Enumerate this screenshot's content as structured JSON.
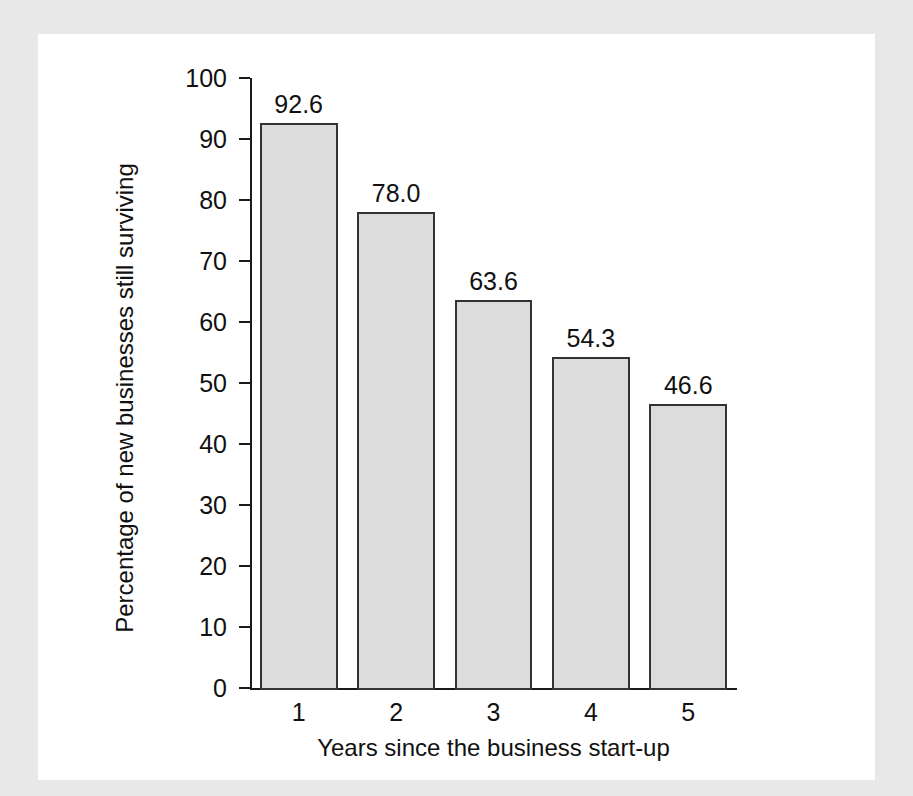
{
  "figure": {
    "background_color": "#e8e8e8",
    "card_color": "#ffffff"
  },
  "chart_data": {
    "type": "bar",
    "title": "",
    "xlabel": "Years since the business start-up",
    "ylabel": "Percentage of new businesses still surviving",
    "categories": [
      "1",
      "2",
      "3",
      "4",
      "5"
    ],
    "values": [
      92.6,
      78.0,
      63.6,
      54.3,
      46.6
    ],
    "value_labels": [
      "92.6",
      "78.0",
      "63.6",
      "54.3",
      "46.6"
    ],
    "ylim": [
      0,
      100
    ],
    "ytick_labels": [
      "0",
      "10",
      "20",
      "30",
      "40",
      "50",
      "60",
      "70",
      "80",
      "90",
      "100"
    ],
    "yticks": [
      0,
      10,
      20,
      30,
      40,
      50,
      60,
      70,
      80,
      90,
      100
    ],
    "grid": false,
    "legend": null,
    "bar_fill_color": "#dcdcdc",
    "bar_edge_color": "#333333",
    "axis_color": "#1a1a1a"
  }
}
